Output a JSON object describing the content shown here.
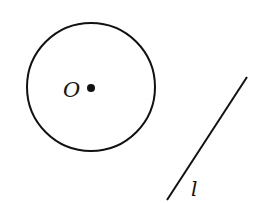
{
  "diagram": {
    "circle": {
      "center_label": "O",
      "cx": 91,
      "cy": 87,
      "r": 64
    },
    "center_point": {
      "x": 91,
      "y": 88,
      "r": 4
    },
    "line": {
      "label": "l",
      "x1": 247,
      "y1": 77,
      "x2": 167,
      "y2": 200
    },
    "colors": {
      "stroke": "#111111",
      "background": "#ffffff"
    }
  }
}
